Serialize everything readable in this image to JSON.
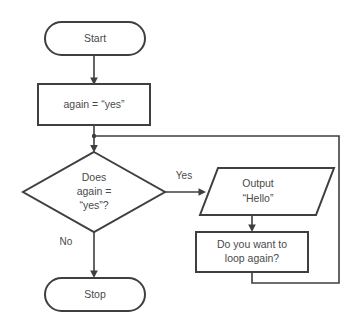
{
  "diagram": {
    "background_color": "#ffffff",
    "line_color": "#3f3f3f",
    "text_color": "#4a4a4a",
    "nodes": {
      "start": {
        "label": "Start",
        "shape": "terminator"
      },
      "assign": {
        "label": "again = “yes”",
        "shape": "process"
      },
      "decision": {
        "line1": "Does",
        "line2": "again =",
        "line3": "“yes”?",
        "shape": "decision"
      },
      "output": {
        "line1": "Output",
        "line2": "“Hello”",
        "shape": "parallelogram"
      },
      "prompt": {
        "line1": "Do you want to",
        "line2": "loop again?",
        "shape": "process"
      },
      "stop": {
        "label": "Stop",
        "shape": "terminator"
      }
    },
    "edges": {
      "yes_label": "Yes",
      "no_label": "No"
    }
  }
}
